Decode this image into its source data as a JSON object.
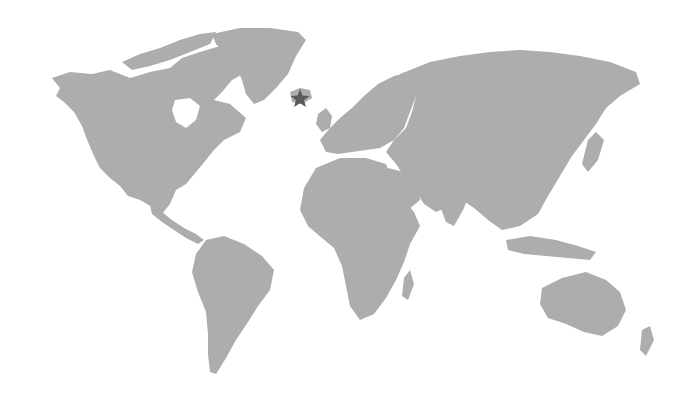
{
  "map": {
    "type": "world-map",
    "projection": "mercator-like",
    "land_color": "#adadad",
    "water_color": "#ffffff",
    "labels": [],
    "markers": [
      {
        "shape": "star",
        "location": "Iceland",
        "x": 300,
        "y": 98,
        "color": "#5a5a5a"
      }
    ]
  }
}
